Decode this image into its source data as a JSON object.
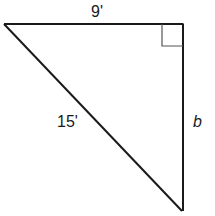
{
  "diagram": {
    "type": "right-triangle",
    "vertices": {
      "top_left": [
        4,
        24
      ],
      "top_right_right_angle": [
        183,
        24
      ],
      "bottom_right": [
        183,
        211
      ]
    },
    "right_angle_marker": {
      "corner": "top-right",
      "size": 21
    },
    "labels": {
      "top_side": "9'",
      "hypotenuse": "15'",
      "right_side": "b"
    },
    "stroke_color": "#1a1a1a",
    "marker_color": "#555555"
  }
}
